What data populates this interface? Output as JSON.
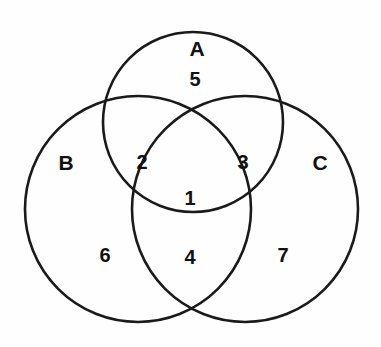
{
  "figure": {
    "type": "venn-diagram-3-set",
    "background_color": "#fefefe",
    "stroke_color": "#1a1a1a",
    "label_color": "#111111"
  },
  "sets": [
    {
      "id": "A",
      "label": "A",
      "label_x": 197,
      "label_y": 48,
      "cx": 193,
      "cy": 122,
      "r": 90
    },
    {
      "id": "B",
      "label": "B",
      "label_x": 66,
      "label_y": 162,
      "cx": 138,
      "cy": 209,
      "r": 113
    },
    {
      "id": "C",
      "label": "C",
      "label_x": 320,
      "label_y": 162,
      "cx": 245,
      "cy": 209,
      "r": 113
    }
  ],
  "regions": [
    {
      "id": "abc",
      "label": "1",
      "description": "A and B and C",
      "x": 190,
      "y": 198
    },
    {
      "id": "ab",
      "label": "2",
      "description": "A and B only",
      "x": 142,
      "y": 162
    },
    {
      "id": "ac",
      "label": "3",
      "description": "A and C only",
      "x": 243,
      "y": 162
    },
    {
      "id": "bc",
      "label": "4",
      "description": "B and C only",
      "x": 190,
      "y": 257
    },
    {
      "id": "a",
      "label": "5",
      "description": "A only",
      "x": 195,
      "y": 79
    },
    {
      "id": "b",
      "label": "6",
      "description": "B only",
      "x": 105,
      "y": 255
    },
    {
      "id": "c",
      "label": "7",
      "description": "C only",
      "x": 283,
      "y": 255
    }
  ]
}
